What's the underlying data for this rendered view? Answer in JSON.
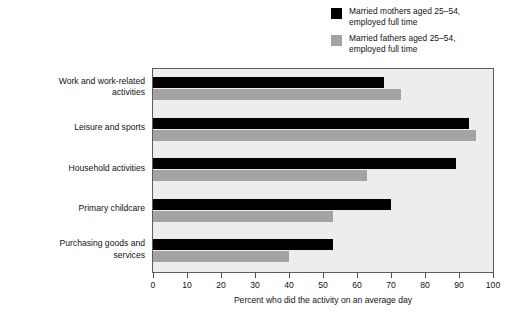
{
  "chart_data": {
    "type": "bar",
    "orientation": "horizontal",
    "title": "",
    "subtitle": "",
    "xlabel": "Percent who did the activity on an average day",
    "ylabel": "",
    "xlim": [
      0,
      100
    ],
    "xticks": [
      0,
      10,
      20,
      30,
      40,
      50,
      60,
      70,
      80,
      90,
      100
    ],
    "grid": false,
    "legend_position": "top-right",
    "categories": [
      "Work and work-related\nactivities",
      "Leisure and sports",
      "Household activities",
      "Primary childcare",
      "Purchasing goods and\nservices"
    ],
    "series": [
      {
        "name": "Married mothers aged 25–54,\nemployed full time",
        "color": "#000000",
        "values": [
          68,
          93,
          89,
          70,
          53
        ]
      },
      {
        "name": "Married fathers aged 25–54,\nemployed full time",
        "color": "#a3a3a3",
        "values": [
          73,
          95,
          63,
          53,
          40
        ]
      }
    ]
  },
  "legend": {
    "items": [
      {
        "label": "Married mothers aged 25–54,\nemployed full time",
        "color": "#000000"
      },
      {
        "label": "Married fathers aged 25–54,\nemployed full time",
        "color": "#a3a3a3"
      }
    ]
  },
  "axis": {
    "x_title": "Percent who did the activity on an average day",
    "x_tick_labels": [
      "0",
      "10",
      "20",
      "30",
      "40",
      "50",
      "60",
      "70",
      "80",
      "90",
      "100"
    ]
  },
  "categories": [
    "Work and work-related\nactivities",
    "Leisure and sports",
    "Household activities",
    "Primary childcare",
    "Purchasing goods and\nservices"
  ],
  "colors": {
    "series_mothers": "#000000",
    "series_fathers": "#a3a3a3",
    "plot_background": "#ededed",
    "plot_border": "#5d5d5d",
    "page_background": "#ffffff"
  }
}
